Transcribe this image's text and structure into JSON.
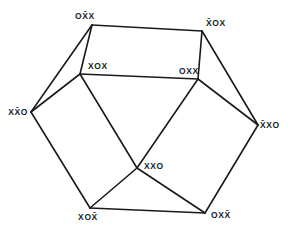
{
  "diagram": {
    "type": "graph",
    "vertices": [
      {
        "id": "v1",
        "label": "OX̄X",
        "x": 92,
        "y": 25,
        "label_dx": -7,
        "label_dy": -6,
        "anchor": "middle"
      },
      {
        "id": "v2",
        "label": "X̄OX",
        "x": 202,
        "y": 31,
        "label_dx": 4,
        "label_dy": -5,
        "anchor": "start"
      },
      {
        "id": "v3",
        "label": "XOX",
        "x": 80,
        "y": 74,
        "label_dx": 8,
        "label_dy": -5,
        "anchor": "start"
      },
      {
        "id": "v4",
        "label": "OXX",
        "x": 198,
        "y": 79,
        "label_dx": -19,
        "label_dy": -5,
        "anchor": "start"
      },
      {
        "id": "v5",
        "label": "XX̄O",
        "x": 31,
        "y": 112,
        "label_dx": -3,
        "label_dy": 3,
        "anchor": "end"
      },
      {
        "id": "v6",
        "label": "X̄XO",
        "x": 258,
        "y": 125,
        "label_dx": 2,
        "label_dy": 3,
        "anchor": "start"
      },
      {
        "id": "v7",
        "label": "XXO",
        "x": 137,
        "y": 168,
        "label_dx": 7,
        "label_dy": 1,
        "anchor": "start"
      },
      {
        "id": "v8",
        "label": "XOX̄",
        "x": 90,
        "y": 208,
        "label_dx": -2,
        "label_dy": 12,
        "anchor": "middle"
      },
      {
        "id": "v9",
        "label": "OXX̄",
        "x": 205,
        "y": 213,
        "label_dx": 6,
        "label_dy": 5,
        "anchor": "start"
      }
    ],
    "edges": [
      [
        "v1",
        "v2"
      ],
      [
        "v1",
        "v3"
      ],
      [
        "v1",
        "v5"
      ],
      [
        "v2",
        "v4"
      ],
      [
        "v2",
        "v6"
      ],
      [
        "v3",
        "v4"
      ],
      [
        "v3",
        "v5"
      ],
      [
        "v3",
        "v7"
      ],
      [
        "v4",
        "v7"
      ],
      [
        "v4",
        "v6"
      ],
      [
        "v5",
        "v8"
      ],
      [
        "v6",
        "v9"
      ],
      [
        "v7",
        "v8"
      ],
      [
        "v7",
        "v9"
      ],
      [
        "v8",
        "v9"
      ]
    ],
    "colors": {
      "line": "#1a1a1a",
      "background": "#ffffff"
    }
  }
}
